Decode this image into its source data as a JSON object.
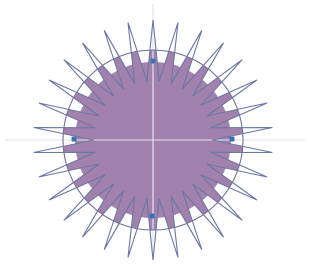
{
  "figure": {
    "width": 309,
    "height": 266,
    "center": {
      "x": 153,
      "y": 140
    },
    "spikes": {
      "count": 30,
      "start_angle_deg": -90,
      "outer_radius": 120,
      "inner_radius": 59
    },
    "fill_circle_radius": 78,
    "outer_ring_radius": 90,
    "guides": {
      "horizontal": {
        "x1": 5,
        "x2": 305,
        "y": 140
      },
      "vertical": {
        "y1": 4,
        "y2": 260,
        "x": 153
      }
    },
    "anchors": [
      {
        "name": "top",
        "x": 153,
        "y": 61
      },
      {
        "name": "right",
        "x": 232,
        "y": 139
      },
      {
        "name": "bottom",
        "x": 152,
        "y": 216
      },
      {
        "name": "left",
        "x": 74,
        "y": 139
      }
    ],
    "colors": {
      "background": "#ffffff",
      "fill": "#a282ad",
      "stroke": "#6b77a6",
      "ring": "#6f6f9a",
      "guide": "#dfe4ee",
      "anchor": "#3f6fb2"
    }
  }
}
